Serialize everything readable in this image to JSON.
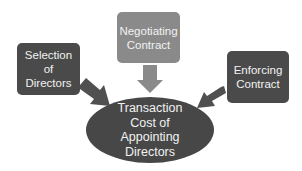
{
  "diagram": {
    "type": "converging-factors",
    "nodes": {
      "selection": {
        "label": "Selection of\nDirectors",
        "color": "#4a4a4a"
      },
      "negotiating": {
        "label": "Negotiating\nContract",
        "color": "#8a8a8a"
      },
      "enforcing": {
        "label": "Enforcing\nContract",
        "color": "#4a4a4a"
      },
      "center": {
        "label": "Transaction\nCost  of\nAppointing\nDirectors",
        "color": "#474747"
      }
    },
    "edges": [
      {
        "from": "Selection of Directors",
        "to": "Transaction Cost of Appointing Directors",
        "color": "#505050"
      },
      {
        "from": "Negotiating Contract",
        "to": "Transaction Cost of Appointing Directors",
        "color": "#8a8a8a"
      },
      {
        "from": "Enforcing Contract",
        "to": "Transaction Cost of Appointing Directors",
        "color": "#505050"
      }
    ]
  }
}
